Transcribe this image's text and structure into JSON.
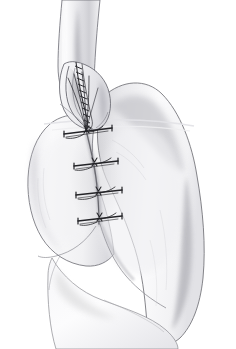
{
  "figure": {
    "medium": "graphite pencil line and tone drawing",
    "background_color": "#ffffff",
    "ink_color": "#3a3a3c",
    "suture_color": "#262628",
    "tone_light": "#f4f4f5",
    "tone_mid": "#e2e2e4",
    "tone_dark": "#c9c9cc",
    "shadow_color": "#9a9a9e",
    "width": 236,
    "height": 349,
    "alt_text": "Pencil drawing of an organ joined to a spatulated tubular structure by a vertical line of four interrupted sutures."
  },
  "structures": [
    {
      "id": "tube-proximal",
      "label": "Tubular structure entering from top of frame",
      "role": "proximal conduit",
      "x": 78,
      "y": 8
    },
    {
      "id": "tube-spatulated-end",
      "label": "Spatulated open end of tube",
      "role": "opened conduit end",
      "x": 80,
      "y": 85
    },
    {
      "id": "organ-left-lobe",
      "label": "Left lobe of organ",
      "role": "recipient organ, left aspect",
      "x": 45,
      "y": 180
    },
    {
      "id": "organ-right-lobe",
      "label": "Right lobe of organ",
      "role": "recipient organ, right bulging aspect",
      "x": 160,
      "y": 180
    },
    {
      "id": "organ-lower-pole",
      "label": "Lower pole of organ",
      "role": "inferior extent of organ",
      "x": 120,
      "y": 300
    },
    {
      "id": "incision-line",
      "label": "Longitudinal incision closure line",
      "role": "anastomotic seam",
      "x": 96,
      "y": 175
    }
  ],
  "sutures": {
    "type": "interrupted",
    "count": 4,
    "color": "#262628",
    "knots": [
      {
        "index": 1,
        "x": 86,
        "y": 131,
        "arm_left": 22,
        "arm_right": 26,
        "tilt": -4
      },
      {
        "index": 2,
        "x": 94,
        "y": 163,
        "arm_left": 20,
        "arm_right": 24,
        "tilt": -3
      },
      {
        "index": 3,
        "x": 98,
        "y": 192,
        "arm_left": 22,
        "arm_right": 24,
        "tilt": -2
      },
      {
        "index": 4,
        "x": 99,
        "y": 218,
        "arm_left": 22,
        "arm_right": 22,
        "tilt": -2
      }
    ],
    "running_edge": {
      "label": "Running suture along spatulated tube edge",
      "start_x": 78,
      "start_y": 62,
      "end_x": 88,
      "end_y": 126,
      "stitch_count": 12
    },
    "free_tails": {
      "label": "Free suture tails fanning above the first knot",
      "count": 5,
      "origin_x": 86,
      "origin_y": 131
    }
  },
  "chart_data": {
    "type": "scatter",
    "xlabel": "x (px)",
    "ylabel": "y (px)",
    "x": [
      86,
      94,
      98,
      99
    ],
    "values": [
      131,
      163,
      192,
      218
    ],
    "categories": [
      "stitch 1",
      "stitch 2",
      "stitch 3",
      "stitch 4"
    ],
    "xlim": [
      0,
      236
    ],
    "ylim": [
      349,
      0
    ],
    "grid": false,
    "legend": "none"
  }
}
